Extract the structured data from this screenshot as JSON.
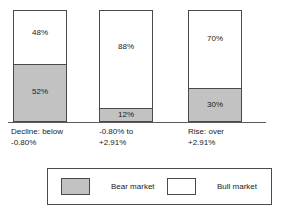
{
  "chart_data": {
    "type": "bar",
    "subtype": "stacked-100-percent",
    "title": "",
    "subtitle": "",
    "xlabel": "",
    "ylabel": "",
    "ylim": [
      0,
      100
    ],
    "grid": false,
    "legend_position": "bottom",
    "categories": [
      "Decline: below\n-0.80%",
      "-0.80% to\n+2.91%",
      "Rise: over\n+2.91%"
    ],
    "series": [
      {
        "name": "Bear market",
        "color": "#c2c2c2",
        "values": [
          52,
          12,
          30
        ],
        "value_labels": [
          "52%",
          "12%",
          "30%"
        ]
      },
      {
        "name": "Bull market",
        "color": "#ffffff",
        "values": [
          48,
          88,
          70
        ],
        "value_labels": [
          "48%",
          "88%",
          "70%"
        ]
      }
    ]
  },
  "legend": {
    "items": [
      {
        "label": "Bear market",
        "swatch": "bear-market-swatch"
      },
      {
        "label": "Bull market",
        "swatch": "bull-market-swatch"
      }
    ]
  },
  "colors": {
    "bear": "#c2c2c2",
    "bull": "#ffffff",
    "outline": "#4a4a4a",
    "text": "#1a1a1a",
    "background": "#ffffff"
  }
}
